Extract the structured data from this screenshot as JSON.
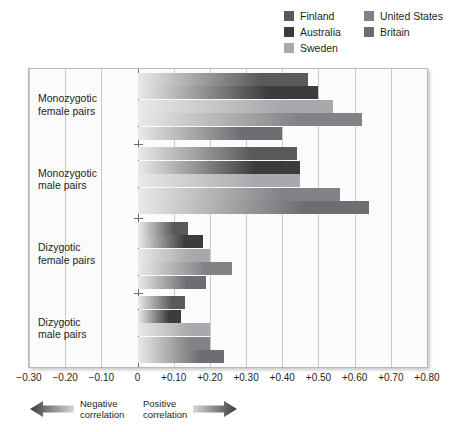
{
  "legend": {
    "items": [
      {
        "label": "Finland",
        "color": "#58595b",
        "col": 1
      },
      {
        "label": "Australia",
        "color": "#3b3c3e",
        "col": 1
      },
      {
        "label": "Sweden",
        "color": "#a7a9ac",
        "col": 1
      },
      {
        "label": "United States",
        "color": "#808285",
        "col": 2
      },
      {
        "label": "Britain",
        "color": "#6d6e71",
        "col": 2
      }
    ]
  },
  "footer": {
    "negative_line1": "Negative",
    "negative_line2": "correlation",
    "positive_line1": "Positive",
    "positive_line2": "correlation"
  },
  "chart_data": {
    "type": "bar",
    "orientation": "horizontal",
    "title": "",
    "xlabel": "",
    "ylabel": "",
    "xlim": [
      -0.3,
      0.8
    ],
    "xticks": [
      -0.3,
      -0.2,
      -0.1,
      0,
      0.1,
      0.2,
      0.3,
      0.4,
      0.5,
      0.6,
      0.7,
      0.8
    ],
    "xticklabels": [
      "−0.30",
      "−0.20",
      "−0.10",
      "0",
      "+0.10",
      "+0.20",
      "+0.30",
      "+0.40",
      "+0.50",
      "+0.60",
      "+0.70",
      "+0.80"
    ],
    "grid": true,
    "legend_position": "top-right",
    "categories": [
      "Monozygotic female pairs",
      "Monozygotic male pairs",
      "Dizygotic female pairs",
      "Dizygotic male pairs"
    ],
    "category_lines": [
      [
        "Monozygotic",
        "female pairs"
      ],
      [
        "Monozygotic",
        "male pairs"
      ],
      [
        "Dizygotic",
        "female pairs"
      ],
      [
        "Dizygotic",
        "male pairs"
      ]
    ],
    "series": [
      {
        "name": "Finland",
        "color": "#58595b",
        "values": [
          0.47,
          0.44,
          0.14,
          0.13
        ]
      },
      {
        "name": "Australia",
        "color": "#3b3c3e",
        "values": [
          0.5,
          0.45,
          0.18,
          0.12
        ]
      },
      {
        "name": "Sweden",
        "color": "#a7a9ac",
        "values": [
          0.54,
          0.45,
          0.2,
          0.2
        ]
      },
      {
        "name": "United States",
        "color": "#808285",
        "values": [
          0.62,
          0.56,
          0.26,
          0.2
        ]
      },
      {
        "name": "Britain",
        "color": "#6d6e71",
        "values": [
          0.4,
          0.64,
          0.19,
          0.24
        ]
      }
    ]
  }
}
